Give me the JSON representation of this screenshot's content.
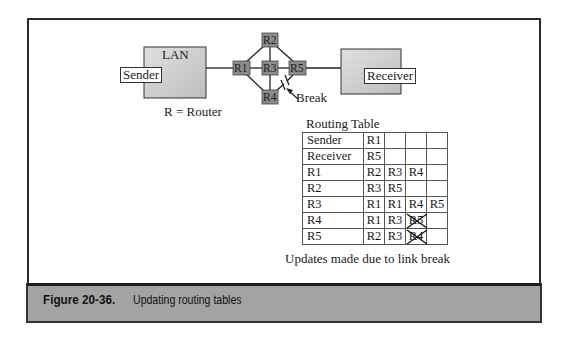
{
  "diagram": {
    "lan_label": "LAN",
    "sender_label": "Sender",
    "receiver_label": "Receiver",
    "routers": [
      "R1",
      "R2",
      "R3",
      "R4",
      "R5"
    ],
    "break_label": "Break",
    "legend": "R = Router"
  },
  "routing_table": {
    "title": "Routing Table",
    "rows": [
      {
        "name": "Sender",
        "hops": [
          "R1",
          "",
          "",
          ""
        ]
      },
      {
        "name": "Receiver",
        "hops": [
          "R5",
          "",
          "",
          ""
        ]
      },
      {
        "name": "R1",
        "hops": [
          "R2",
          "R3",
          "R4",
          ""
        ]
      },
      {
        "name": "R2",
        "hops": [
          "R3",
          "R5",
          "",
          ""
        ]
      },
      {
        "name": "R3",
        "hops": [
          "R1",
          "R1",
          "R4",
          "R5"
        ]
      },
      {
        "name": "R4",
        "hops": [
          "R1",
          "R3",
          "R5",
          ""
        ],
        "crossed_index": 2
      },
      {
        "name": "R5",
        "hops": [
          "R2",
          "R3",
          "R4",
          ""
        ],
        "crossed_index": 2
      }
    ],
    "caption": "Updates made due to link break"
  },
  "figure": {
    "number": "Figure 20-36.",
    "title": "Updating routing tables"
  },
  "colors": {
    "box_fill": "#cfcfcf",
    "router_fill": "#8c8c8c",
    "banner": "#a3a3a3"
  }
}
